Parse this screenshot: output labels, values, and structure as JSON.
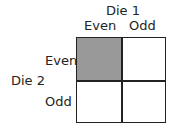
{
  "die1": {
    "title": "Die 1",
    "columns": [
      "Even",
      "Odd"
    ]
  },
  "die2": {
    "title": "Die 2",
    "rows": [
      "Even",
      "Odd"
    ]
  },
  "cells": [
    {
      "row": "Even",
      "col": "Even",
      "shaded": true,
      "color": "#999999"
    },
    {
      "row": "Even",
      "col": "Odd",
      "shaded": false,
      "color": "#ffffff"
    },
    {
      "row": "Odd",
      "col": "Even",
      "shaded": false,
      "color": "#ffffff"
    },
    {
      "row": "Odd",
      "col": "Odd",
      "shaded": false,
      "color": "#ffffff"
    }
  ]
}
